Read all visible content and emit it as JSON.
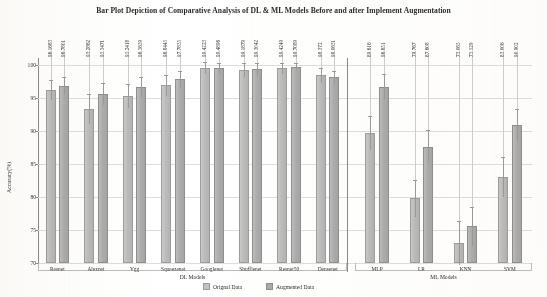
{
  "chart_data": {
    "type": "bar",
    "title": "Bar Plot Depiction of Comparative Analysis of DL & ML Models Before and after Implement Augmentation",
    "xlabel": "",
    "ylabel": "Accuracy(%)",
    "ylim": [
      70,
      101
    ],
    "yticks": [
      70,
      75,
      80,
      85,
      90,
      95,
      100
    ],
    "grid": true,
    "legend_position": "bottom-center",
    "group_labels": [
      "DL Models",
      "ML Models"
    ],
    "categories": [
      "Resnet",
      "Alexnet",
      "Vgg",
      "Squeezenet",
      "Googlenet",
      "Shufflenet",
      "Resnet50",
      "Densenet",
      "MLP",
      "LR",
      "KNN",
      "SVM"
    ],
    "groups": [
      {
        "name": "DL Models",
        "categories": [
          "Resnet",
          "Alexnet",
          "Vgg",
          "Squeezenet",
          "Googlenet",
          "Shufflenet",
          "Resnet50",
          "Densenet"
        ]
      },
      {
        "name": "ML Models",
        "categories": [
          "MLP",
          "LR",
          "KNN",
          "SVM"
        ]
      }
    ],
    "series": [
      {
        "name": "Orignal Data",
        "values": [
          96.1683,
          93.2862,
          95.2418,
          96.8445,
          99.4223,
          99.1879,
          99.4249,
          98.372,
          89.616,
          79.767,
          73.065,
          83.006
        ],
        "labels": [
          "96.1683",
          "93.2862",
          "95.2418",
          "96.8445",
          "99.4223",
          "99.1879",
          "99.4249",
          "98.372",
          "89.616",
          "79.767",
          "73.065",
          "83.006"
        ]
      },
      {
        "name": "Augmented Data",
        "values": [
          96.7801,
          95.5471,
          96.5659,
          97.7835,
          99.4896,
          99.3042,
          99.7089,
          98.0631,
          96.651,
          87.608,
          75.529,
          90.902
        ],
        "labels": [
          "96.7801",
          "95.5471",
          "96.5659",
          "97.7835",
          "99.4896",
          "99.3042",
          "99.7089",
          "98.0631",
          "96.651",
          "87.608",
          "75.529",
          "90.902"
        ]
      }
    ],
    "error_bars": {
      "orignal": [
        1.5,
        2.2,
        1.8,
        1.6,
        0.9,
        1.0,
        0.8,
        1.1,
        2.6,
        2.8,
        3.3,
        3.0
      ],
      "augmented": [
        1.4,
        1.7,
        1.5,
        1.3,
        0.7,
        0.9,
        0.6,
        1.0,
        1.9,
        2.5,
        2.9,
        2.4
      ]
    }
  },
  "legend": {
    "items": [
      {
        "label": "Orignal Data"
      },
      {
        "label": "Augmented Data"
      }
    ]
  },
  "axes": {
    "y_title": "Accuracy(%)",
    "tick_labels": [
      "100",
      "95",
      "90",
      "85",
      "80",
      "75",
      "70"
    ]
  }
}
